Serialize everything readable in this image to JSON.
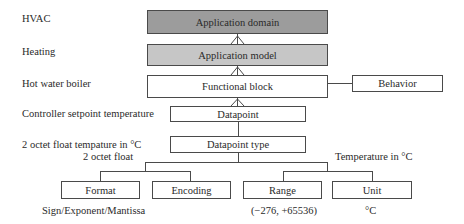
{
  "diagram": {
    "left_labels": [
      "HVAC",
      "Heating",
      "Hot water boiler",
      "Controller setpoint temperature",
      "2 octet float tempature in °C"
    ],
    "stack": [
      {
        "label": "Application domain",
        "fill": "#9c9c9c"
      },
      {
        "label": "Application model",
        "fill": "#c6c6c6"
      },
      {
        "label": "Functional block",
        "fill": "#ffffff"
      },
      {
        "label": "Datapoint",
        "fill": "#ffffff"
      },
      {
        "label": "Datapoint type",
        "fill": "#ffffff"
      }
    ],
    "side_box": {
      "label": "Behavior"
    },
    "branch_labels": {
      "left": "2 octet float",
      "right": "Temperature in °C"
    },
    "leaves": [
      {
        "label": "Format",
        "note": "Sign/Exponent/Mantissa"
      },
      {
        "label": "Encoding",
        "note": ""
      },
      {
        "label": "Range",
        "note": "(−276, +65536)"
      },
      {
        "label": "Unit",
        "note": "°C"
      }
    ]
  }
}
